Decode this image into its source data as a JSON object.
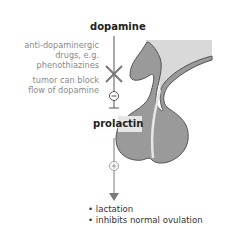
{
  "labels": {
    "dopamine": "dopamine",
    "prolactin": "prolactin",
    "drug_note_line1": "anti-dopaminergic",
    "drug_note_line2": "drugs, e.g.",
    "drug_note_line3": "phenothiazines",
    "tumor_note_line1": "tumor can block",
    "tumor_note_line2": "flow of dopamine"
  },
  "effects": [
    "• lactation",
    "• inhibits normal ovulation"
  ],
  "symbols": {
    "inhibit": "−",
    "stimulate": "+"
  },
  "colors": {
    "gland": "#9a9a9a",
    "gland_light": "#d6d6d6",
    "line": "#555555",
    "arrow": "#7a7a7a",
    "note_text": "#8a8a8a"
  }
}
